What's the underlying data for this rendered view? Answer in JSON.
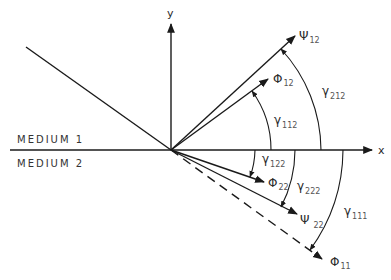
{
  "diagram": {
    "axes": {
      "x_label": "x",
      "y_label": "y"
    },
    "media": {
      "upper": "MEDIUM 1",
      "lower": "MEDIUM 2"
    },
    "rays": [
      {
        "id": "incident",
        "style": "solid",
        "label": ""
      },
      {
        "id": "psi12",
        "symbol": "Ψ",
        "subscript": "12",
        "style": "solid"
      },
      {
        "id": "phi12",
        "symbol": "Φ",
        "subscript": "12",
        "style": "solid"
      },
      {
        "id": "phi22",
        "symbol": "Φ",
        "subscript": "22",
        "style": "solid"
      },
      {
        "id": "psi22",
        "symbol": "Ψ",
        "subscript": "22",
        "style": "solid"
      },
      {
        "id": "phi11",
        "symbol": "Φ",
        "subscript": "11",
        "style": "dashed"
      }
    ],
    "angles": [
      {
        "id": "gamma112",
        "symbol": "γ",
        "subscript": "112"
      },
      {
        "id": "gamma212",
        "symbol": "γ",
        "subscript": "212"
      },
      {
        "id": "gamma122",
        "symbol": "γ",
        "subscript": "122"
      },
      {
        "id": "gamma222",
        "symbol": "γ",
        "subscript": "222"
      },
      {
        "id": "gamma111",
        "symbol": "γ",
        "subscript": "111"
      }
    ]
  }
}
